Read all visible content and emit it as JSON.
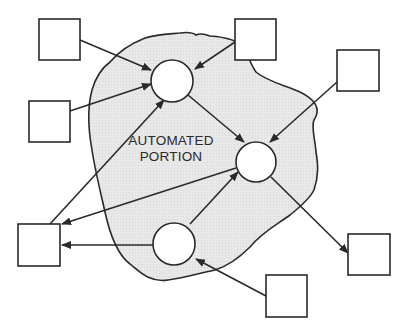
{
  "diagram": {
    "title": "",
    "region": {
      "label_line1": "AUTOMATED",
      "label_line2": "PORTION",
      "fill": "#e6e6e6",
      "stroke": "#2a2a2a"
    },
    "colors": {
      "stroke": "#2a2a2a",
      "box_fill": "#ffffff",
      "circle_fill": "#ffffff"
    },
    "nodes": {
      "circles": [
        {
          "id": "process-top",
          "cx": 172,
          "cy": 81,
          "r": 21
        },
        {
          "id": "process-right",
          "cx": 256,
          "cy": 162,
          "r": 20
        },
        {
          "id": "process-bottom",
          "cx": 174,
          "cy": 244,
          "r": 21
        }
      ],
      "boxes": [
        {
          "id": "external-1",
          "x": 39,
          "y": 19,
          "w": 41,
          "h": 41
        },
        {
          "id": "external-2",
          "x": 29,
          "y": 101,
          "w": 41,
          "h": 41
        },
        {
          "id": "external-3",
          "x": 235,
          "y": 19,
          "w": 41,
          "h": 41
        },
        {
          "id": "external-4",
          "x": 337,
          "y": 50,
          "w": 42,
          "h": 41
        },
        {
          "id": "external-5",
          "x": 18,
          "y": 224,
          "w": 42,
          "h": 42
        },
        {
          "id": "external-6",
          "x": 348,
          "y": 234,
          "w": 42,
          "h": 41
        },
        {
          "id": "external-7",
          "x": 266,
          "y": 275,
          "w": 41,
          "h": 42
        }
      ]
    },
    "edges": [
      {
        "from": "external-1",
        "to": "process-top"
      },
      {
        "from": "external-2",
        "to": "process-top"
      },
      {
        "from": "external-3",
        "to": "process-top"
      },
      {
        "from": "external-5",
        "to": "process-top"
      },
      {
        "from": "process-top",
        "to": "process-right"
      },
      {
        "from": "external-4",
        "to": "process-right"
      },
      {
        "from": "process-bottom",
        "to": "process-right"
      },
      {
        "from": "process-right",
        "to": "external-5"
      },
      {
        "from": "process-right",
        "to": "external-6"
      },
      {
        "from": "process-bottom",
        "to": "external-5"
      },
      {
        "from": "external-7",
        "to": "process-bottom"
      }
    ]
  }
}
